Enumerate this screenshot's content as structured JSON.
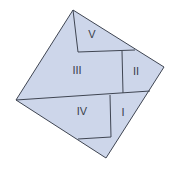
{
  "diagram": {
    "type": "dissection-square",
    "fill_color": "#cdd6ea",
    "stroke_color": "#3f4552",
    "outer_square": [
      [
        73,
        10
      ],
      [
        164,
        67
      ],
      [
        106,
        158
      ],
      [
        16,
        100
      ]
    ],
    "pieces": [
      {
        "id": "V",
        "label": "V",
        "x": 92,
        "y": 35
      },
      {
        "id": "III",
        "label": "III",
        "x": 77,
        "y": 71
      },
      {
        "id": "II",
        "label": "II",
        "x": 136,
        "y": 72
      },
      {
        "id": "IV",
        "label": "IV",
        "x": 82,
        "y": 112
      },
      {
        "id": "I",
        "label": "I",
        "x": 123,
        "y": 113
      }
    ]
  }
}
